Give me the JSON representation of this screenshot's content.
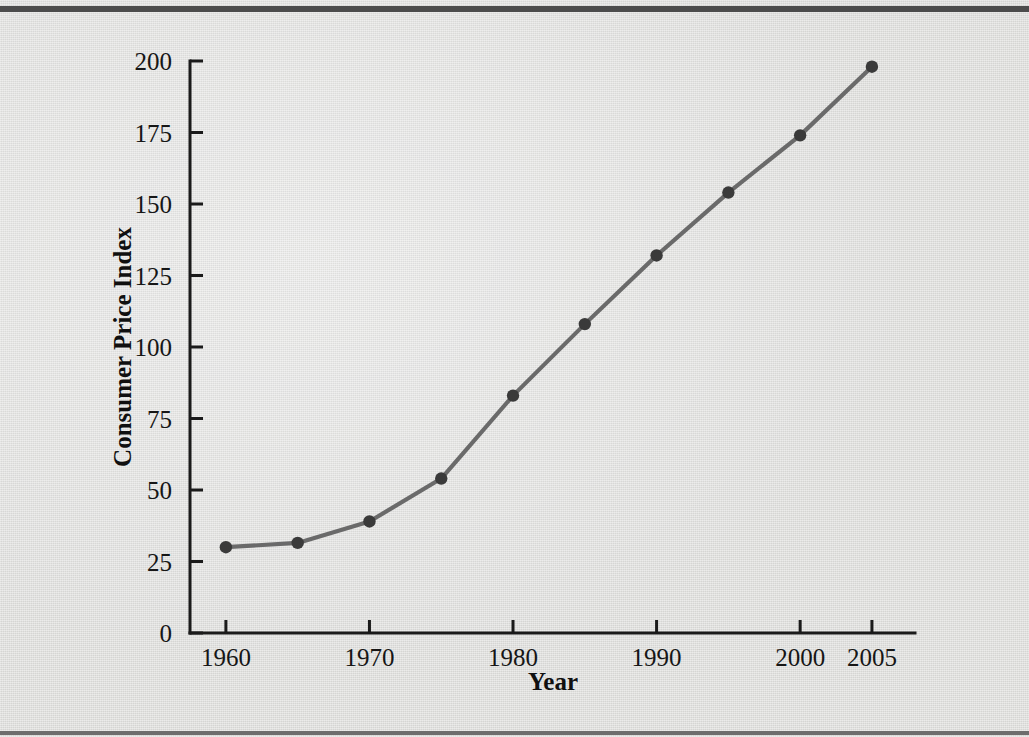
{
  "figure": {
    "background_color": "#dcdcda",
    "line_color": "#6a6a6a",
    "marker_color": "#3a3a3a",
    "axis_color": "#1a1a1a"
  },
  "chart_data": {
    "type": "line",
    "title": "",
    "subtitle": "",
    "xlabel": "Year",
    "ylabel": "Consumer Price Index",
    "x": [
      1960,
      1965,
      1970,
      1975,
      1980,
      1985,
      1990,
      1995,
      2000,
      2005
    ],
    "values": [
      30,
      31.5,
      39,
      54,
      83,
      108,
      132,
      154,
      174,
      198
    ],
    "series": [
      {
        "name": "Consumer Price Index",
        "values": [
          30,
          31.5,
          39,
          54,
          83,
          108,
          132,
          154,
          174,
          198
        ]
      }
    ],
    "xlim": [
      1957.5,
      2008
    ],
    "ylim": [
      0,
      200
    ],
    "xticks": [
      1960,
      1970,
      1980,
      1990,
      2000,
      2005
    ],
    "xtick_labels": [
      "1960",
      "1970",
      "1980",
      "1990",
      "2000",
      "2005"
    ],
    "yticks": [
      0,
      25,
      50,
      75,
      100,
      125,
      150,
      175,
      200
    ],
    "ytick_labels": [
      "0",
      "25",
      "50",
      "75",
      "100",
      "125",
      "150",
      "175",
      "200"
    ],
    "grid": false,
    "legend": null,
    "legend_position": "none",
    "markers": "circle",
    "annotations": []
  }
}
